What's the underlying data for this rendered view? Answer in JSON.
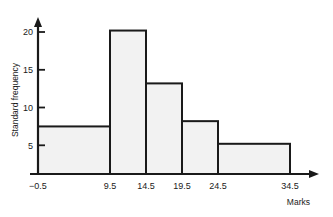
{
  "chart_data": {
    "type": "bar",
    "title": "",
    "subtitle": "",
    "xlabel": "Marks",
    "ylabel": "Standard frequency",
    "grid": false,
    "legend": null,
    "bin_edges": [
      -0.5,
      9.5,
      14.5,
      19.5,
      24.5,
      34.5
    ],
    "categories": [
      "-0.5 to 9.5",
      "9.5 to 14.5",
      "14.5 to 19.5",
      "19.5 to 24.5",
      "24.5 to 34.5"
    ],
    "values": [
      6.3,
      19,
      12,
      7,
      4
    ],
    "xlim": [
      -0.5,
      34.5
    ],
    "ylim": [
      0,
      21
    ],
    "x_tick_labels": [
      "−0.5",
      "9.5",
      "14.5",
      "19.5",
      "24.5",
      "34.5"
    ],
    "x_tick_values": [
      -0.5,
      9.5,
      14.5,
      19.5,
      24.5,
      34.5
    ],
    "y_tick_labels": [
      "5",
      "10",
      "15",
      "20"
    ],
    "y_tick_values": [
      5,
      10,
      15,
      20
    ],
    "bar_fill_color": "#f2f2f2",
    "bar_edge_color": "#1a1a1a",
    "axis_color": "#1a1a1a",
    "background_color": "#ffffff"
  },
  "axes": {
    "y_title": "Standard frequency",
    "x_title": "Marks"
  }
}
